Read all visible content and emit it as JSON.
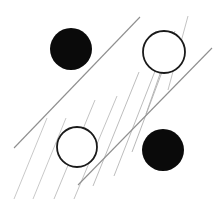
{
  "canvas": {
    "width": 221,
    "height": 199,
    "background_color": "#ffffff",
    "title": "Abstract line-and-circle figure"
  },
  "palette": {
    "filled_circle_color": "#0a0a0a",
    "outline_circle_stroke": "#1a1a1a",
    "outline_circle_fill": "#ffffff",
    "thin_line_color": "#b8b8b8",
    "long_line_color": "#8f8f8f"
  },
  "chart_data": {
    "type": "scatter",
    "title": "",
    "xlabel": "",
    "ylabel": "",
    "xlim": [
      0,
      221
    ],
    "ylim": [
      0,
      199
    ],
    "grid": false,
    "legend": "none",
    "shapes": {
      "circles": [
        {
          "id": "circle-top-left",
          "label": "filled circle top left",
          "style": "filled",
          "cx": 71,
          "cy": 49,
          "r": 21,
          "fill": "#0a0a0a",
          "stroke": "none",
          "stroke_width": 0
        },
        {
          "id": "circle-top-right",
          "label": "outlined circle top right",
          "style": "outlined",
          "cx": 164,
          "cy": 52,
          "r": 21,
          "fill": "#ffffff",
          "stroke": "#1a1a1a",
          "stroke_width": 1.8
        },
        {
          "id": "circle-bottom-left",
          "label": "outlined circle bottom left",
          "style": "outlined",
          "cx": 77,
          "cy": 147,
          "r": 20,
          "fill": "#ffffff",
          "stroke": "#1a1a1a",
          "stroke_width": 1.8
        },
        {
          "id": "circle-bottom-right",
          "label": "filled circle bottom right",
          "style": "filled",
          "cx": 163,
          "cy": 150,
          "r": 21,
          "fill": "#0a0a0a",
          "stroke": "none",
          "stroke_width": 0
        }
      ],
      "thin_lines": [
        {
          "id": "thin-line-1",
          "x1": 14,
          "y1": 199,
          "x2": 47,
          "y2": 118,
          "stroke": "#c2c2c2",
          "stroke_width": 0.9
        },
        {
          "id": "thin-line-2",
          "x1": 33,
          "y1": 199,
          "x2": 66,
          "y2": 118,
          "stroke": "#c2c2c2",
          "stroke_width": 0.9
        },
        {
          "id": "thin-line-3",
          "x1": 54,
          "y1": 199,
          "x2": 95,
          "y2": 100,
          "stroke": "#bcbcbc",
          "stroke_width": 0.9
        },
        {
          "id": "thin-line-4",
          "x1": 74,
          "y1": 199,
          "x2": 117,
          "y2": 96,
          "stroke": "#bcbcbc",
          "stroke_width": 0.9
        },
        {
          "id": "thin-line-5",
          "x1": 93,
          "y1": 186,
          "x2": 139,
          "y2": 72,
          "stroke": "#b6b6b6",
          "stroke_width": 0.9
        },
        {
          "id": "thin-line-6",
          "x1": 114,
          "y1": 176,
          "x2": 157,
          "y2": 66,
          "stroke": "#b6b6b6",
          "stroke_width": 0.9
        },
        {
          "id": "thin-line-7",
          "x1": 132,
          "y1": 152,
          "x2": 168,
          "y2": 56,
          "stroke": "#b0b0b0",
          "stroke_width": 0.9
        },
        {
          "id": "thin-line-8",
          "x1": 146,
          "y1": 114,
          "x2": 175,
          "y2": 31,
          "stroke": "#b0b0b0",
          "stroke_width": 0.9
        },
        {
          "id": "thin-line-9",
          "x1": 168,
          "y1": 90,
          "x2": 188,
          "y2": 16,
          "stroke": "#bcbcbc",
          "stroke_width": 0.9
        }
      ],
      "long_lines": [
        {
          "id": "long-line-lower",
          "x1": 14,
          "y1": 148,
          "x2": 140,
          "y2": 17,
          "stroke": "#8f8f8f",
          "stroke_width": 1.1
        },
        {
          "id": "long-line-upper",
          "x1": 78,
          "y1": 185,
          "x2": 212,
          "y2": 48,
          "stroke": "#8f8f8f",
          "stroke_width": 1.1
        }
      ]
    }
  }
}
